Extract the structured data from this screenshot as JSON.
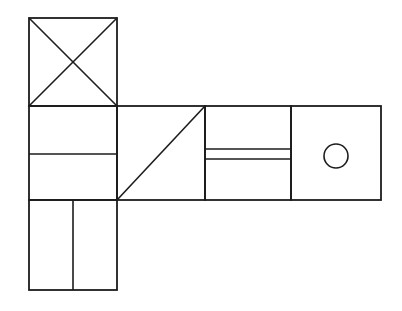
{
  "document": {
    "title": "Orthographic line drawing",
    "background_color": "#ffffff",
    "line_color": "#1c1c1c",
    "canvas": {
      "width": 402,
      "height": 311
    }
  },
  "chart_data": {
    "type": "diagram",
    "subtitle": "",
    "xlabel": "",
    "ylabel": "",
    "units": "pixels",
    "xlim": [
      0,
      402
    ],
    "ylim": [
      0,
      311
    ],
    "grid": false,
    "legend": "none",
    "annotations": [],
    "stroke_color": "#1c1c1c",
    "stroke_width": 1.6,
    "shapes": [
      {
        "name": "top-square-with-x",
        "kind": "rect",
        "x": 29,
        "y": 18,
        "width": 88,
        "height": 88,
        "stroke_width": 1.8
      },
      {
        "name": "x-diagonal-down",
        "kind": "line",
        "x1": 29,
        "y1": 18,
        "x2": 117,
        "y2": 106,
        "stroke_width": 1.6
      },
      {
        "name": "x-diagonal-up",
        "kind": "line",
        "x1": 117,
        "y1": 18,
        "x2": 29,
        "y2": 106,
        "stroke_width": 1.6
      },
      {
        "name": "left-middle-rect",
        "kind": "rect",
        "x": 29,
        "y": 106,
        "width": 88,
        "height": 94,
        "stroke_width": 1.8
      },
      {
        "name": "left-middle-horizontal-divider",
        "kind": "line",
        "x1": 29,
        "y1": 154,
        "x2": 117,
        "y2": 154,
        "stroke_width": 1.6
      },
      {
        "name": "bottom-rect",
        "kind": "rect",
        "x": 29,
        "y": 200,
        "width": 88,
        "height": 90,
        "stroke_width": 1.8
      },
      {
        "name": "bottom-rect-vertical-divider",
        "kind": "line",
        "x1": 73,
        "y1": 200,
        "x2": 73,
        "y2": 290,
        "stroke_width": 1.6
      },
      {
        "name": "triangle-panel",
        "kind": "rect",
        "x": 117,
        "y": 106,
        "width": 88,
        "height": 94,
        "stroke_width": 1.8
      },
      {
        "name": "triangle-hypotenuse",
        "kind": "line",
        "x1": 117,
        "y1": 200,
        "x2": 205,
        "y2": 106,
        "stroke_width": 1.6
      },
      {
        "name": "slot-panel",
        "kind": "rect",
        "x": 205,
        "y": 106,
        "width": 86,
        "height": 94,
        "stroke_width": 1.8
      },
      {
        "name": "slot-line-upper",
        "kind": "line",
        "x1": 205,
        "y1": 149,
        "x2": 291,
        "y2": 149,
        "stroke_width": 1.6
      },
      {
        "name": "slot-line-lower",
        "kind": "line",
        "x1": 205,
        "y1": 159,
        "x2": 291,
        "y2": 159,
        "stroke_width": 1.6
      },
      {
        "name": "circle-panel",
        "kind": "rect",
        "x": 291,
        "y": 106,
        "width": 90,
        "height": 94,
        "stroke_width": 1.8
      },
      {
        "name": "hole-circle",
        "kind": "circle",
        "cx": 336,
        "cy": 156,
        "r": 12,
        "stroke_width": 1.6
      }
    ]
  }
}
